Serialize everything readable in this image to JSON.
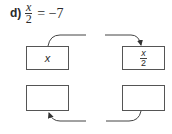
{
  "problem": {
    "label": "d)",
    "equation": {
      "numerator": "x",
      "denominator": "2",
      "rest": "= −7"
    }
  },
  "flowchart": {
    "top_left_box": {
      "text": "x"
    },
    "top_right_box": {
      "numerator": "x",
      "denominator": "2"
    },
    "bottom_left_box": {
      "text": ""
    },
    "bottom_right_box": {
      "text": ""
    },
    "arrows": [
      {
        "from": "top_left_box",
        "to": "top_right_box",
        "direction": "right"
      },
      {
        "from": "bottom_right_box",
        "to": "bottom_left_box",
        "direction": "left"
      }
    ],
    "stroke_color": "#444444"
  }
}
